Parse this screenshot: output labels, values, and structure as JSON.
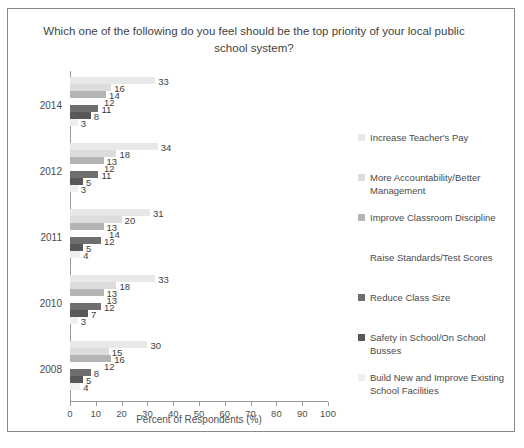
{
  "chart_data": {
    "type": "bar",
    "orientation": "horizontal",
    "title": "Which one of the following do you feel should be the top priority of your local public school system?",
    "xlabel": "Percent of Respondents (%)",
    "ylabel": "",
    "xlim": [
      0,
      100
    ],
    "xticks": [
      0,
      10,
      20,
      30,
      40,
      50,
      60,
      70,
      80,
      90,
      100
    ],
    "grid": false,
    "legend_position": "right",
    "categories": [
      "2014",
      "2012",
      "2011",
      "2010",
      "2008"
    ],
    "series": [
      {
        "name": "Increase Teacher's Pay",
        "color": "#e8e8e8",
        "values": [
          33,
          34,
          31,
          33,
          30
        ]
      },
      {
        "name": "More Accountability/Better Management",
        "color": "#dcdcdc",
        "values": [
          16,
          18,
          20,
          18,
          15
        ]
      },
      {
        "name": "Improve Classroom Discipline",
        "color": "#b4b4b4",
        "values": [
          14,
          13,
          13,
          13,
          16
        ]
      },
      {
        "name": "Raise Standards/Test Scores",
        "color": "#ffffff",
        "values": [
          12,
          12,
          14,
          13,
          12
        ]
      },
      {
        "name": "Reduce Class Size",
        "color": "#6e6e6e",
        "values": [
          11,
          11,
          12,
          12,
          8
        ]
      },
      {
        "name": "Safety in School/On School Busses",
        "color": "#585858",
        "values": [
          8,
          5,
          5,
          7,
          5
        ]
      },
      {
        "name": "Build New and Improve Existing School Facilities",
        "color": "#efefef",
        "values": [
          3,
          3,
          4,
          3,
          4
        ]
      }
    ]
  },
  "legend": {
    "items": [
      {
        "label": "Increase Teacher's Pay"
      },
      {
        "label": "More Accountability/Better Management"
      },
      {
        "label": "Improve Classroom Discipline"
      },
      {
        "label": "Raise Standards/Test Scores"
      },
      {
        "label": "Reduce Class Size"
      },
      {
        "label": "Safety in School/On School Busses"
      },
      {
        "label": "Build New and Improve Existing School Facilities"
      }
    ]
  }
}
